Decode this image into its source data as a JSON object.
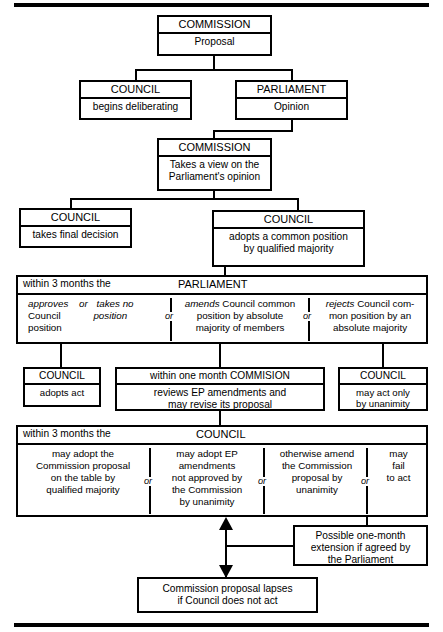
{
  "diagram": {
    "rules": {
      "top": "horizontal-rule",
      "bottom": "horizontal-rule"
    },
    "nodes": {
      "commission_proposal": {
        "header": "COMMISSION",
        "body": "Proposal"
      },
      "council_deliberating": {
        "header": "COUNCIL",
        "body": "begins deliberating"
      },
      "parliament_opinion": {
        "header": "PARLIAMENT",
        "body": "Opinion"
      },
      "commission_view": {
        "header": "COMMISSION",
        "body_line1": "Takes a view on the",
        "body_line2": "Parliament's opinion"
      },
      "council_final": {
        "header": "COUNCIL",
        "body": "takes final decision"
      },
      "council_common_position": {
        "header": "COUNCIL",
        "body_line1": "adopts a common position",
        "body_line2": "by qualified majority"
      },
      "council_adopts_act": {
        "header": "COUNCIL",
        "body": "adopts act"
      },
      "commission_review": {
        "header": "within one month COMMISION",
        "body_line1": "reviews EP amendments and",
        "body_line2": "may revise its proposal"
      },
      "council_unanimity": {
        "header": "COUNCIL",
        "body_line1": "may act only",
        "body_line2": "by unanimity"
      },
      "extension": {
        "line1": "Possible one-month",
        "line2": "extension if agreed by",
        "line3": "the Parliament"
      },
      "lapses": {
        "line1": "Commission proposal lapses",
        "line2": "if Council does not act"
      }
    },
    "parliament_stage": {
      "label": "within 3 months the",
      "title": "PARLIAMENT",
      "or_1": "or",
      "or_2": "or",
      "options": [
        {
          "id": "approves",
          "line1_it_a": "approves",
          "line1_it_b": "or",
          "line1_it_c": "takes no",
          "line2_plain": "Council",
          "line2_it": "position",
          "line3_plain": "position"
        },
        {
          "id": "amends",
          "lead_it": "amends",
          "line1_rest": " Council common",
          "line2": "position by absolute",
          "line3": "majority of members"
        },
        {
          "id": "rejects",
          "lead_it": "rejects",
          "line1_rest": " Council com-",
          "line2": "mon position by an",
          "line3": "absolute majority"
        }
      ]
    },
    "council_stage": {
      "label": "within 3 months the",
      "title": "COUNCIL",
      "or_1": "or",
      "or_2": "or",
      "or_3": "or",
      "options": [
        {
          "id": "adopt-commission-proposal",
          "line1": "may adopt the",
          "line2": "Commission proposal",
          "line3": "on the table by",
          "line4": "qualified majority"
        },
        {
          "id": "adopt-ep-amendments",
          "line1": "may adopt EP",
          "line2": "amendments",
          "line3": "not approved by",
          "line4": "the Commission",
          "line5": "by unanimity"
        },
        {
          "id": "amend-commission-proposal",
          "line1": "otherwise amend",
          "line2": "the Commission",
          "line3": "proposal by",
          "line4": "unanimity"
        },
        {
          "id": "fail-to-act",
          "line1": "may",
          "line2": "fail",
          "line3": "to act"
        }
      ]
    }
  }
}
